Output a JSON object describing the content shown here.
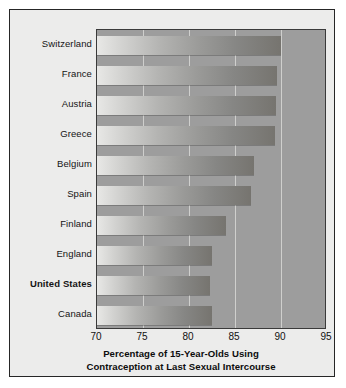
{
  "chart_data": {
    "type": "bar",
    "orientation": "horizontal",
    "title": "Percentage of 15-Year-Olds Using Contraception at Last Sexual Intercourse",
    "title_line1": "Percentage of 15-Year-Olds Using",
    "title_line2": "Contraception at Last Sexual Intercourse",
    "xlabel": "",
    "ylabel": "",
    "xlim": [
      70,
      95
    ],
    "ticks": [
      "70",
      "75",
      "80",
      "85",
      "90",
      "95"
    ],
    "tick_values": [
      70,
      75,
      80,
      85,
      90,
      95
    ],
    "grid": true,
    "legend": "none",
    "categories": [
      "Switzerland",
      "France",
      "Austria",
      "Greece",
      "Belgium",
      "Spain",
      "Finland",
      "England",
      "United States",
      "Canada"
    ],
    "values": [
      90.0,
      89.6,
      89.5,
      89.4,
      87.1,
      86.7,
      84.0,
      82.5,
      82.3,
      82.5
    ],
    "highlighted_category": "United States",
    "bars": [
      {
        "label": "Switzerland",
        "value": 90.0,
        "bold": false
      },
      {
        "label": "France",
        "value": 89.6,
        "bold": false
      },
      {
        "label": "Austria",
        "value": 89.5,
        "bold": false
      },
      {
        "label": "Greece",
        "value": 89.4,
        "bold": false
      },
      {
        "label": "Belgium",
        "value": 87.1,
        "bold": false
      },
      {
        "label": "Spain",
        "value": 86.7,
        "bold": false
      },
      {
        "label": "Finland",
        "value": 84.0,
        "bold": false
      },
      {
        "label": "England",
        "value": 82.5,
        "bold": false
      },
      {
        "label": "United States",
        "value": 82.3,
        "bold": true
      },
      {
        "label": "Canada",
        "value": 82.5,
        "bold": false
      }
    ],
    "colors": {
      "figure_background": "#ececeb",
      "plot_background": "#9d9d9d",
      "bar_gradient_start": "#e8e8e6",
      "bar_gradient_end": "#76746f",
      "gridline": "#d8d8d6",
      "border": "#262626",
      "text": "#111111"
    }
  }
}
